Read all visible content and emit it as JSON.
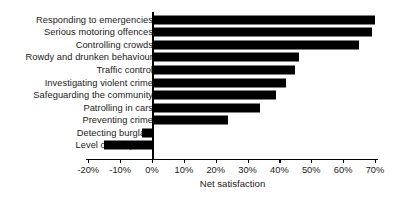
{
  "chart_data": {
    "type": "bar",
    "orientation": "horizontal",
    "title": "",
    "xlabel": "Net satisfaction",
    "ylabel": "",
    "categories": [
      "Responding to emergencies",
      "Serious motoring offences",
      "Controlling crowds",
      "Rowdy and drunken behaviour",
      "Traffic control",
      "Investigating violent crime",
      "Safeguarding the community",
      "Patrolling in cars",
      "Preventing crime",
      "Detecting burglars",
      "Level of foot patrol"
    ],
    "values": [
      70,
      69,
      65,
      46,
      45,
      42,
      39,
      34,
      24,
      -3,
      -15
    ],
    "xlim": [
      -22,
      72
    ],
    "xticks": [
      -20,
      -10,
      0,
      10,
      20,
      30,
      40,
      50,
      60,
      70
    ],
    "xtick_labels": [
      "-20%",
      "-10%",
      "0%",
      "10%",
      "20%",
      "30%",
      "40%",
      "50%",
      "60%",
      "70%"
    ],
    "grid": false,
    "legend": null,
    "bar_color": "#000000",
    "background_color": "#ffffff"
  }
}
